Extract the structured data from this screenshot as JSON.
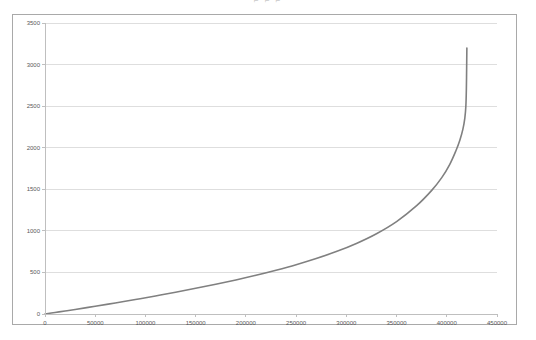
{
  "clipped_caption": "⌐                    ⌐          ⌐",
  "chart_data": {
    "type": "line",
    "title": "",
    "subtitle": "",
    "xlabel": "",
    "ylabel": "",
    "xlim": [
      0,
      450000
    ],
    "ylim": [
      0,
      3500
    ],
    "xticks": [
      0,
      50000,
      100000,
      150000,
      200000,
      250000,
      300000,
      350000,
      400000,
      450000
    ],
    "yticks": [
      0,
      500,
      1000,
      1500,
      2000,
      2500,
      3000,
      3500
    ],
    "xtick_labels": [
      "0",
      "50000",
      "100000",
      "150000",
      "200000",
      "250000",
      "300000",
      "350000",
      "400000",
      "450000"
    ],
    "ytick_labels": [
      "0",
      "500",
      "1000",
      "1500",
      "2000",
      "2500",
      "3000",
      "3500"
    ],
    "grid": "horizontal",
    "legend": "none",
    "series": [
      {
        "name": "curve",
        "color": "#808080",
        "line_width": 1.6,
        "x": [
          0,
          10000,
          20000,
          30000,
          40000,
          50000,
          70000,
          90000,
          110000,
          130000,
          150000,
          170000,
          190000,
          210000,
          230000,
          250000,
          270000,
          290000,
          310000,
          330000,
          350000,
          370000,
          385000,
          395000,
          403000,
          409000,
          413000,
          416000,
          418000,
          419000,
          419500,
          419800,
          420000
        ],
        "y": [
          0,
          18,
          36,
          55,
          74,
          93,
          133,
          174,
          217,
          262,
          309,
          358,
          410,
          466,
          527,
          593,
          667,
          751,
          849,
          966,
          1112,
          1303,
          1487,
          1640,
          1800,
          1960,
          2090,
          2220,
          2360,
          2500,
          2700,
          2980,
          3200
        ]
      }
    ]
  }
}
